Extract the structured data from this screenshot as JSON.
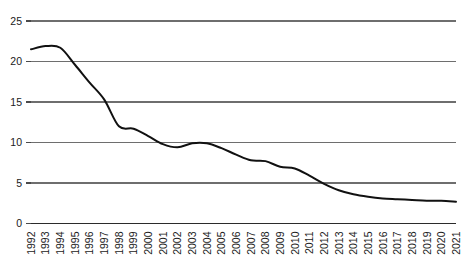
{
  "chart_data": {
    "type": "line",
    "title": "",
    "subtitle": "",
    "xlabel": "",
    "ylabel": "",
    "xlim": [
      1992,
      2021
    ],
    "ylim": [
      0,
      25
    ],
    "grid": true,
    "legend": false,
    "legend_position": "none",
    "line_color": "#111111",
    "gridline_color": "#6e6e6e",
    "axis_color": "#2b2b2b",
    "y_ticks": [
      0,
      5,
      10,
      15,
      20,
      25
    ],
    "y_tick_labels": [
      "0",
      "5",
      "10",
      "15",
      "20",
      "25"
    ],
    "categories": [
      "1992",
      "1993",
      "1994",
      "1995",
      "1996",
      "1997",
      "1998",
      "1999",
      "2000",
      "2001",
      "2002",
      "2003",
      "2004",
      "2005",
      "2006",
      "2007",
      "2008",
      "2009",
      "2010",
      "2011",
      "2012",
      "2013",
      "2014",
      "2015",
      "2016",
      "2017",
      "2018",
      "2019",
      "2020",
      "2021"
    ],
    "x": [
      1992,
      1993,
      1994,
      1995,
      1996,
      1997,
      1998,
      1999,
      2000,
      2001,
      2002,
      2003,
      2004,
      2005,
      2006,
      2007,
      2008,
      2009,
      2010,
      2011,
      2012,
      2013,
      2014,
      2015,
      2016,
      2017,
      2018,
      2019,
      2020,
      2021
    ],
    "values": [
      21.5,
      21.9,
      21.7,
      19.6,
      17.4,
      15.3,
      12.0,
      11.7,
      10.8,
      9.8,
      9.4,
      9.9,
      9.9,
      9.3,
      8.5,
      7.8,
      7.7,
      7.0,
      6.8,
      5.9,
      4.9,
      4.1,
      3.6,
      3.3,
      3.1,
      3.0,
      2.9,
      2.8,
      2.8,
      2.7
    ],
    "series": [
      {
        "name": "series-1",
        "values": [
          21.5,
          21.9,
          21.7,
          19.6,
          17.4,
          15.3,
          12.0,
          11.7,
          10.8,
          9.8,
          9.4,
          9.9,
          9.9,
          9.3,
          8.5,
          7.8,
          7.7,
          7.0,
          6.8,
          5.9,
          4.9,
          4.1,
          3.6,
          3.3,
          3.1,
          3.0,
          2.9,
          2.8,
          2.8,
          2.7
        ]
      }
    ]
  }
}
